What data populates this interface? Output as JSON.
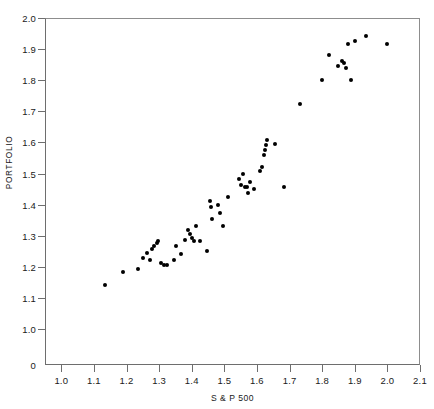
{
  "chart_data": {
    "type": "scatter",
    "title": "",
    "xlabel": "S & P 500",
    "ylabel": "PORTFOLIO",
    "xlim": [
      0.95,
      2.1
    ],
    "ylim": [
      0.0,
      2.0
    ],
    "grid": false,
    "legend": null,
    "marker": {
      "shape": "circle",
      "color": "#000000",
      "size_px": 4
    },
    "xticks": [
      "1.0",
      "1.1",
      "1.2",
      "1.3",
      "1.4",
      "1.5",
      "1.6",
      "1.7",
      "1.8",
      "1.9",
      "2.0",
      "2.1"
    ],
    "xtick_values": [
      1.0,
      1.1,
      1.2,
      1.3,
      1.4,
      1.5,
      1.6,
      1.7,
      1.8,
      1.9,
      2.0,
      2.1
    ],
    "yticks": [
      "0",
      "1.0",
      "1.1",
      "1.2",
      "1.3",
      "1.4",
      "1.5",
      "1.6",
      "1.7",
      "1.8",
      "1.9",
      "2.0"
    ],
    "ytick_values": [
      0.0,
      1.0,
      1.1,
      1.2,
      1.3,
      1.4,
      1.5,
      1.6,
      1.7,
      1.8,
      1.9,
      2.0
    ],
    "y_axis_note": "axis broken between 0 and 1.0",
    "points": [
      [
        1.135,
        1.143
      ],
      [
        1.19,
        1.183
      ],
      [
        1.235,
        1.192
      ],
      [
        1.25,
        1.228
      ],
      [
        1.262,
        1.243
      ],
      [
        1.272,
        1.222
      ],
      [
        1.278,
        1.258
      ],
      [
        1.285,
        1.268
      ],
      [
        1.292,
        1.275
      ],
      [
        1.298,
        1.282
      ],
      [
        1.305,
        1.213
      ],
      [
        1.315,
        1.205
      ],
      [
        1.325,
        1.205
      ],
      [
        1.345,
        1.222
      ],
      [
        1.352,
        1.268
      ],
      [
        1.368,
        1.242
      ],
      [
        1.378,
        1.285
      ],
      [
        1.388,
        1.318
      ],
      [
        1.395,
        1.305
      ],
      [
        1.4,
        1.292
      ],
      [
        1.408,
        1.282
      ],
      [
        1.412,
        1.33
      ],
      [
        1.425,
        1.283
      ],
      [
        1.448,
        1.25
      ],
      [
        1.455,
        1.412
      ],
      [
        1.458,
        1.392
      ],
      [
        1.462,
        1.355
      ],
      [
        1.48,
        1.398
      ],
      [
        1.488,
        1.372
      ],
      [
        1.495,
        1.33
      ],
      [
        1.512,
        1.425
      ],
      [
        1.545,
        1.482
      ],
      [
        1.552,
        1.462
      ],
      [
        1.558,
        1.5
      ],
      [
        1.562,
        1.455
      ],
      [
        1.568,
        1.455
      ],
      [
        1.572,
        1.438
      ],
      [
        1.578,
        1.472
      ],
      [
        1.592,
        1.45
      ],
      [
        1.608,
        1.508
      ],
      [
        1.615,
        1.52
      ],
      [
        1.622,
        1.56
      ],
      [
        1.625,
        1.575
      ],
      [
        1.628,
        1.592
      ],
      [
        1.63,
        1.608
      ],
      [
        1.655,
        1.595
      ],
      [
        1.682,
        1.455
      ],
      [
        1.732,
        1.722
      ],
      [
        1.8,
        1.8
      ],
      [
        1.822,
        1.88
      ],
      [
        1.848,
        1.845
      ],
      [
        1.862,
        1.862
      ],
      [
        1.868,
        1.855
      ],
      [
        1.872,
        1.838
      ],
      [
        1.88,
        1.918
      ],
      [
        1.888,
        1.8
      ],
      [
        1.9,
        1.925
      ],
      [
        1.935,
        1.942
      ],
      [
        2.0,
        1.918
      ]
    ]
  }
}
